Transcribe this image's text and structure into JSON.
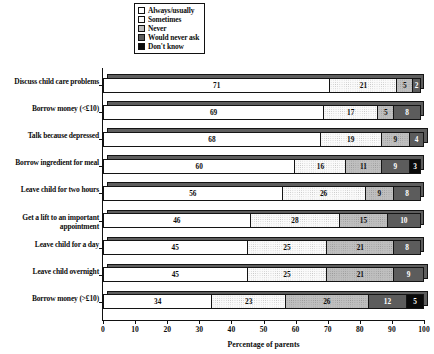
{
  "chart_data": {
    "type": "bar",
    "orientation": "horizontal",
    "stacked": true,
    "title": "",
    "xlabel": "Percentage of parents",
    "ylabel": "",
    "xlim": [
      0,
      100
    ],
    "xticks": [
      0,
      10,
      20,
      30,
      40,
      50,
      60,
      70,
      80,
      90,
      100
    ],
    "grid": false,
    "legend_position": "top-center",
    "legend": [
      {
        "label": "Always/usually",
        "swatch": "white",
        "color": "#ffffff"
      },
      {
        "label": "Sometimes",
        "swatch": "light-dotted",
        "color": "#fafafa"
      },
      {
        "label": "Never",
        "swatch": "grey-dotted",
        "color": "#bfbfbf"
      },
      {
        "label": "Would never ask",
        "swatch": "dark-grey",
        "color": "#5c5c5c"
      },
      {
        "label": "Don't know",
        "swatch": "black",
        "color": "#0a0a0a"
      }
    ],
    "categories": [
      "Discuss child care problems",
      "Borrow money (<£10)",
      "Talk because depressed",
      "Borrow ingredient for meal",
      "Leave child for two hours",
      "Get a lift to an important appointment",
      "Leave child for a day",
      "Leave child overnight",
      "Borrow money (>£10)"
    ],
    "series": [
      {
        "name": "Always/usually",
        "values": [
          71,
          69,
          68,
          60,
          56,
          46,
          45,
          45,
          34
        ]
      },
      {
        "name": "Sometimes",
        "values": [
          21,
          17,
          19,
          16,
          26,
          28,
          25,
          25,
          23
        ]
      },
      {
        "name": "Never",
        "values": [
          5,
          5,
          9,
          11,
          9,
          15,
          21,
          21,
          26
        ]
      },
      {
        "name": "Would never ask",
        "values": [
          2,
          8,
          4,
          9,
          8,
          10,
          8,
          9,
          12
        ]
      },
      {
        "name": "Don't know",
        "values": [
          0,
          0,
          0,
          3,
          0,
          0,
          0,
          0,
          5
        ]
      }
    ],
    "rows": [
      {
        "label": "Discuss child care problems",
        "segments": [
          71,
          21,
          5,
          2,
          0
        ]
      },
      {
        "label": "Borrow money (<£10)",
        "segments": [
          69,
          17,
          5,
          8,
          0
        ]
      },
      {
        "label": "Talk because depressed",
        "segments": [
          68,
          19,
          9,
          4,
          0
        ]
      },
      {
        "label": "Borrow ingredient for meal",
        "segments": [
          60,
          16,
          11,
          9,
          3
        ]
      },
      {
        "label": "Leave child for two hours",
        "segments": [
          56,
          26,
          9,
          8,
          0
        ]
      },
      {
        "label": "Get a lift to an important appointment",
        "segments": [
          46,
          28,
          15,
          10,
          0
        ]
      },
      {
        "label": "Leave child for a day",
        "segments": [
          45,
          25,
          21,
          8,
          0
        ]
      },
      {
        "label": "Leave child overnight",
        "segments": [
          45,
          25,
          21,
          9,
          0
        ]
      },
      {
        "label": "Borrow money (>£10)",
        "segments": [
          34,
          23,
          26,
          12,
          5
        ]
      }
    ]
  }
}
